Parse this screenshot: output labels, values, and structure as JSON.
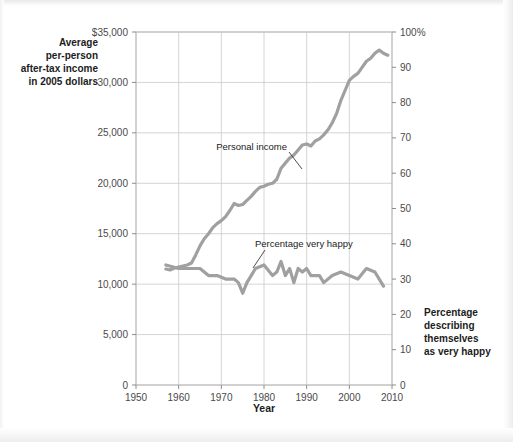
{
  "figure": {
    "background_color": "#ffffff",
    "series_color": "#a0a0a0",
    "grid_color": "#c9c9c9",
    "axis_color": "#8c8c8c",
    "text_color": "#1c1c1c",
    "tick_text_color": "#4a4a4a"
  },
  "axes": {
    "left_caption_lines": [
      "Average",
      "per-person",
      "after-tax income",
      "in 2005 dollars"
    ],
    "right_caption_lines": [
      "Percentage",
      "describing",
      "themselves",
      "as very happy"
    ],
    "x_title": "Year",
    "left_ticks": [
      "$35,000",
      "30,000",
      "25,000",
      "20,000",
      "15,000",
      "10,000",
      "5,000",
      "0"
    ],
    "right_ticks": [
      "100%",
      "90",
      "80",
      "70",
      "60",
      "50",
      "40",
      "30",
      "20",
      "10",
      "0"
    ],
    "x_ticks": [
      "1950",
      "1960",
      "1970",
      "1980",
      "1990",
      "2000",
      "2010"
    ]
  },
  "annotations": {
    "income_label": "Personal income",
    "happy_label": "Percentage very happy"
  },
  "chart_data": {
    "type": "line",
    "title": "",
    "subtitle": "",
    "xlabel": "Year",
    "ylabel": "Average per-person after-tax income in 2005 dollars",
    "y2label": "Percentage describing themselves as very happy",
    "xlim": [
      1950,
      2010
    ],
    "ylim": [
      0,
      35000
    ],
    "y2lim": [
      0,
      100
    ],
    "grid": true,
    "legend": "inline-annotations",
    "x_tick_values": [
      1950,
      1960,
      1970,
      1980,
      1990,
      2000,
      2010
    ],
    "y_tick_values": [
      0,
      5000,
      10000,
      15000,
      20000,
      25000,
      30000,
      35000
    ],
    "y2_tick_values": [
      0,
      10,
      20,
      30,
      40,
      50,
      60,
      70,
      80,
      90,
      100
    ],
    "series": [
      {
        "name": "Personal income",
        "axis": "left",
        "units": "2005 dollars",
        "x": [
          1957,
          1958,
          1959,
          1960,
          1961,
          1962,
          1963,
          1964,
          1965,
          1966,
          1967,
          1968,
          1969,
          1970,
          1971,
          1972,
          1973,
          1974,
          1975,
          1976,
          1977,
          1978,
          1979,
          1980,
          1981,
          1982,
          1983,
          1984,
          1985,
          1986,
          1987,
          1988,
          1989,
          1990,
          1991,
          1992,
          1993,
          1994,
          1995,
          1996,
          1997,
          1998,
          1999,
          2000,
          2001,
          2002,
          2003,
          2004,
          2005,
          2006,
          2007,
          2008,
          2009
        ],
        "y": [
          11500,
          11400,
          11600,
          11700,
          11800,
          11900,
          12100,
          12900,
          13800,
          14500,
          15000,
          15600,
          16000,
          16300,
          16700,
          17300,
          18000,
          17800,
          17900,
          18300,
          18700,
          19200,
          19600,
          19700,
          19900,
          20000,
          20400,
          21500,
          22000,
          22500,
          22800,
          23300,
          23800,
          23900,
          23700,
          24200,
          24400,
          24800,
          25300,
          26000,
          26900,
          28200,
          29200,
          30200,
          30600,
          30900,
          31500,
          32100,
          32400,
          32900,
          33200,
          32900,
          32700
        ]
      },
      {
        "name": "Percentage very happy",
        "axis": "right",
        "units": "percent",
        "x": [
          1957,
          1960,
          1963,
          1965,
          1966,
          1967,
          1969,
          1971,
          1972,
          1973,
          1974,
          1975,
          1976,
          1977,
          1978,
          1980,
          1982,
          1983,
          1984,
          1985,
          1986,
          1987,
          1988,
          1989,
          1990,
          1991,
          1993,
          1994,
          1996,
          1998,
          2000,
          2002,
          2004,
          2006,
          2008
        ],
        "y": [
          34,
          33,
          33,
          33,
          32,
          31,
          31,
          30,
          30,
          30,
          29,
          26,
          29,
          31,
          33,
          34,
          31,
          32,
          35,
          31,
          33,
          29,
          33,
          32,
          33,
          31,
          31,
          29,
          31,
          32,
          31,
          30,
          33,
          32,
          28
        ]
      }
    ]
  }
}
